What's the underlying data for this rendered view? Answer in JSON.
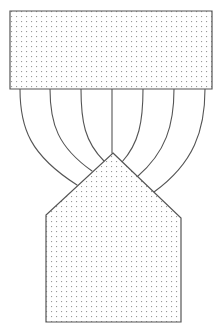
{
  "figure": {
    "width": 222,
    "height": 335,
    "background_color": "#ffffff"
  },
  "style": {
    "stroke_color": "#555555",
    "stroke_width": 1,
    "fill_color": "#ffffff",
    "stipple_dot_color": "#9a9a9a",
    "stipple_spacing": 5,
    "stipple_dot_size": 1
  },
  "shapes": {
    "source_block": {
      "label": "source-block",
      "type": "rectangle",
      "x": 10,
      "y": 11,
      "width": 202,
      "height": 78,
      "filled": true,
      "points": "10,11 212,11 212,89 10,89"
    },
    "target_block": {
      "label": "target-block",
      "type": "pentagon",
      "filled": true,
      "apex": [
        113,
        153
      ],
      "left_shoulder": [
        46,
        215
      ],
      "right_shoulder": [
        181,
        218
      ],
      "bottom_left": [
        46,
        322
      ],
      "bottom_right": [
        181,
        322
      ],
      "points": "113,153 181,218 181,322 46,322 46,215"
    }
  },
  "connectors": {
    "label": "connector-curves",
    "count": 7,
    "origin_y": 89,
    "paths": [
      {
        "name": "connector-1",
        "origin_x": 20,
        "end_x": 77,
        "end_y": 185,
        "d": "M 20,89 C 20,128 30,155 77,185"
      },
      {
        "name": "connector-2",
        "origin_x": 50,
        "end_x": 92,
        "end_y": 171,
        "d": "M 50,89 C 50,124 58,147 92,171"
      },
      {
        "name": "connector-3",
        "origin_x": 81,
        "end_x": 104,
        "end_y": 161,
        "d": "M 81,89 C 81,122 85,142 104,161"
      },
      {
        "name": "connector-4",
        "origin_x": 112,
        "end_x": 112,
        "end_y": 153,
        "d": "M 112,89 L 112,153"
      },
      {
        "name": "connector-5",
        "origin_x": 143,
        "end_x": 122,
        "end_y": 162,
        "d": "M 143,89 C 143,122 139,143 122,162"
      },
      {
        "name": "connector-6",
        "origin_x": 174,
        "end_x": 137,
        "end_y": 177,
        "d": "M 174,89 C 174,125 166,152 137,177"
      },
      {
        "name": "connector-7",
        "origin_x": 205,
        "end_x": 154,
        "end_y": 192,
        "d": "M 205,89 C 205,130 194,163 154,192"
      }
    ]
  }
}
